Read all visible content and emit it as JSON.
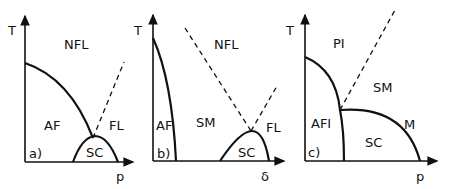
{
  "figure": {
    "panels": [
      {
        "id": "a",
        "tag": "a)",
        "y_axis_label": "T",
        "x_axis_label": "p",
        "regions": [
          "NFL",
          "AF",
          "FL",
          "SC"
        ]
      },
      {
        "id": "b",
        "tag": "b)",
        "y_axis_label": "T",
        "x_axis_label": "δ",
        "regions": [
          "NFL",
          "AF",
          "SM",
          "FL",
          "SC"
        ]
      },
      {
        "id": "c",
        "tag": "c)",
        "y_axis_label": "T",
        "x_axis_label": "p",
        "regions": [
          "PI",
          "SM",
          "AFI",
          "SC",
          "M"
        ]
      }
    ]
  }
}
